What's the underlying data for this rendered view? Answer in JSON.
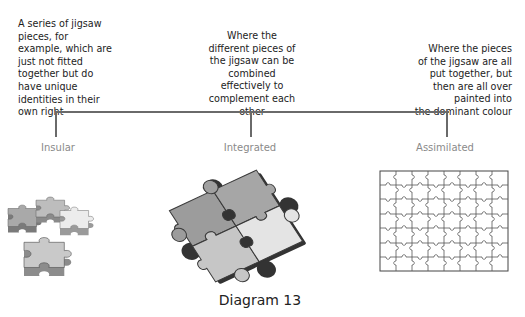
{
  "diagram": {
    "caption": "Diagram 13",
    "categories": [
      {
        "label": "Insular",
        "description_lines": [
          "A series of jigsaw",
          "pieces, for",
          "example, which are",
          "just not fitted",
          "together but do",
          "have unique",
          "identities in their",
          "own right"
        ]
      },
      {
        "label": "Integrated",
        "description_lines": [
          "Where the",
          "different pieces of",
          "the jigsaw can be",
          "combined",
          "effectively to",
          "complement each",
          "other"
        ]
      },
      {
        "label": "Assimilated",
        "description_lines": [
          "Where the pieces",
          "of the jigsaw are all",
          "put together, but",
          "then are all over",
          "painted into",
          "the dominant colour"
        ]
      }
    ],
    "images": [
      {
        "name": "insular-puzzle-pieces",
        "pieces": 4
      },
      {
        "name": "integrated-puzzle-pieces",
        "pieces": 4
      },
      {
        "name": "assimilated-puzzle-grid",
        "columns": 8,
        "rows": 7
      }
    ],
    "colors": {
      "connector_line": "#6a6a6a",
      "category_label": "#8a8a8a",
      "piece_dark": "#9a9a9a",
      "piece_mid": "#b8b8b8",
      "piece_light": "#e2e2e2"
    }
  }
}
